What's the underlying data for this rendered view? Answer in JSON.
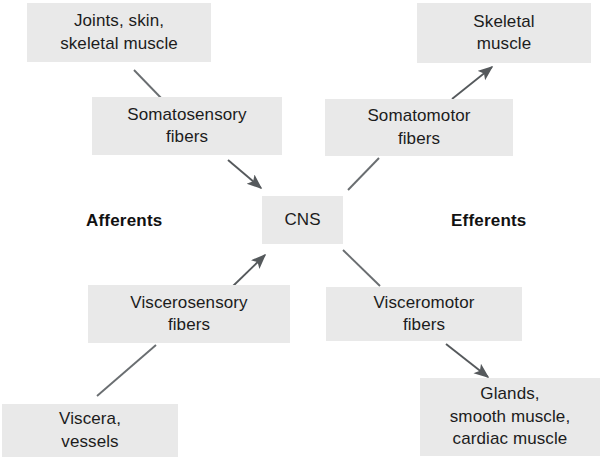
{
  "diagram": {
    "background_color": "#ffffff",
    "box_fill": "#e9e9e9",
    "text_color": "#1c1c1c",
    "connector_color": "#55595c",
    "nodes": {
      "joints_skin": {
        "label": "Joints, skin,\nskeletal muscle"
      },
      "somatosensory": {
        "label": "Somatosensory\nfibers"
      },
      "cns": {
        "label": "CNS"
      },
      "skeletal_muscle": {
        "label": "Skeletal\nmuscle"
      },
      "somatomotor": {
        "label": "Somatomotor\nfibers"
      },
      "viscerosensory": {
        "label": "Viscerosensory\nfibers"
      },
      "viscera_vessels": {
        "label": "Viscera,\nvessels"
      },
      "visceromotor": {
        "label": "Visceromotor\nfibers"
      },
      "glands": {
        "label": "Glands,\nsmooth muscle,\ncardiac muscle"
      }
    },
    "labels": {
      "afferents": "Afferents",
      "efferents": "Efferents"
    }
  }
}
